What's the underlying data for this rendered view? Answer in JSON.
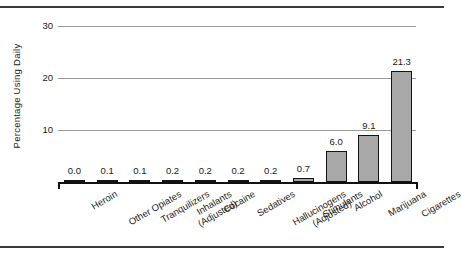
{
  "chart_data": {
    "type": "bar",
    "title": "",
    "xlabel": "",
    "ylabel": "Percentage Using Daily",
    "ylim": [
      0,
      31.5
    ],
    "yticks": [
      10,
      20,
      30
    ],
    "ytick_labels": [
      "10",
      "20",
      "30"
    ],
    "grid": true,
    "legend": false,
    "categories": [
      "Heroin",
      "Other Opiates",
      "Tranquilizers",
      "Inhalants\n(Adjusted)",
      "Cocaine",
      "Sedatives",
      "Hallucinogens\n(Adjusted)",
      "Stimulants",
      "Alcohol",
      "Marijuana",
      "Cigarettes"
    ],
    "values": [
      0.0,
      0.1,
      0.1,
      0.2,
      0.2,
      0.2,
      0.2,
      0.7,
      6.0,
      9.1,
      21.3
    ],
    "value_labels": [
      "0.0",
      "0.1",
      "0.1",
      "0.2",
      "0.2",
      "0.2",
      "0.2",
      "0.7",
      "6.0",
      "9.1",
      "21.3"
    ],
    "bar_fill_color": "#a8a8a8",
    "bar_edge_color": "#141414",
    "gridline_color": "#9a9a9a",
    "axis_color": "#111111"
  },
  "frame": {
    "top_rule": "",
    "bottom_rule": ""
  }
}
